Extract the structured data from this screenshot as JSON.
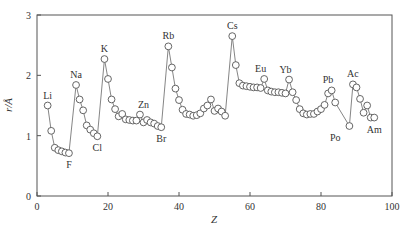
{
  "chart_data": {
    "type": "line",
    "title": "",
    "xlabel": "Z",
    "ylabel": "r/Å",
    "xlim": [
      0,
      100
    ],
    "ylim": [
      0,
      3
    ],
    "xticks": [
      0,
      20,
      40,
      60,
      80,
      100
    ],
    "yticks": [
      0,
      1,
      2,
      3
    ],
    "grid": false,
    "legend": null,
    "marker": "open-circle",
    "series": [
      {
        "name": "atomic radius",
        "x": [
          3,
          4,
          5,
          6,
          7,
          8,
          9,
          11,
          12,
          13,
          14,
          15,
          16,
          17,
          19,
          20,
          21,
          22,
          23,
          24,
          25,
          26,
          27,
          28,
          29,
          30,
          31,
          32,
          33,
          34,
          35,
          37,
          38,
          39,
          40,
          41,
          42,
          43,
          44,
          45,
          46,
          47,
          48,
          49,
          50,
          51,
          52,
          53,
          55,
          56,
          57,
          58,
          59,
          60,
          61,
          62,
          63,
          64,
          65,
          66,
          67,
          68,
          69,
          70,
          71,
          72,
          73,
          74,
          75,
          76,
          77,
          78,
          79,
          80,
          81,
          82,
          83,
          84,
          88,
          89,
          90,
          91,
          92,
          93,
          94,
          95
        ],
        "y": [
          1.5,
          1.08,
          0.8,
          0.76,
          0.74,
          0.72,
          0.71,
          1.84,
          1.6,
          1.42,
          1.17,
          1.1,
          1.04,
          0.99,
          2.27,
          1.94,
          1.6,
          1.44,
          1.32,
          1.36,
          1.27,
          1.26,
          1.25,
          1.25,
          1.35,
          1.22,
          1.26,
          1.22,
          1.2,
          1.16,
          1.14,
          2.48,
          2.13,
          1.78,
          1.59,
          1.43,
          1.36,
          1.35,
          1.33,
          1.34,
          1.37,
          1.45,
          1.5,
          1.6,
          1.41,
          1.45,
          1.4,
          1.33,
          2.65,
          2.17,
          1.87,
          1.83,
          1.82,
          1.81,
          1.8,
          1.8,
          1.79,
          1.94,
          1.75,
          1.73,
          1.72,
          1.72,
          1.71,
          1.7,
          1.93,
          1.72,
          1.59,
          1.44,
          1.37,
          1.35,
          1.36,
          1.36,
          1.4,
          1.44,
          1.51,
          1.7,
          1.75,
          1.55,
          1.16,
          1.85,
          1.8,
          1.61,
          1.38,
          1.5,
          1.3,
          1.3
        ]
      }
    ],
    "annotations": [
      {
        "text": "Li",
        "x": 3,
        "y": 1.5,
        "pos": "above"
      },
      {
        "text": "F",
        "x": 9,
        "y": 0.71,
        "pos": "below"
      },
      {
        "text": "Na",
        "x": 11,
        "y": 1.84,
        "pos": "above"
      },
      {
        "text": "Cl",
        "x": 17,
        "y": 0.99,
        "pos": "below"
      },
      {
        "text": "K",
        "x": 19,
        "y": 2.27,
        "pos": "above"
      },
      {
        "text": "Zn",
        "x": 30,
        "y": 1.35,
        "pos": "above"
      },
      {
        "text": "Br",
        "x": 35,
        "y": 1.14,
        "pos": "below"
      },
      {
        "text": "Rb",
        "x": 37,
        "y": 2.48,
        "pos": "above"
      },
      {
        "text": "Cs",
        "x": 55,
        "y": 2.65,
        "pos": "above"
      },
      {
        "text": "Eu",
        "x": 63,
        "y": 1.94,
        "pos": "above"
      },
      {
        "text": "Yb",
        "x": 70,
        "y": 1.93,
        "pos": "above"
      },
      {
        "text": "Pb",
        "x": 82,
        "y": 1.75,
        "pos": "above"
      },
      {
        "text": "Po",
        "x": 84,
        "y": 1.16,
        "pos": "below"
      },
      {
        "text": "Ac",
        "x": 89,
        "y": 1.85,
        "pos": "above"
      },
      {
        "text": "Am",
        "x": 95,
        "y": 1.3,
        "pos": "below"
      }
    ]
  },
  "axes": {
    "x_label": "Z",
    "y_label": "r/Å",
    "x_tick_labels": [
      "0",
      "20",
      "40",
      "60",
      "80",
      "100"
    ],
    "y_tick_labels": [
      "0",
      "1",
      "2",
      "3"
    ]
  }
}
